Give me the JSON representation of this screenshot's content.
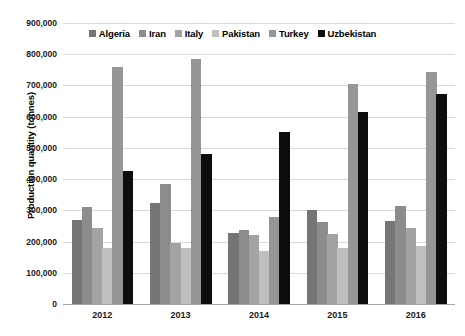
{
  "chart_data": {
    "type": "bar",
    "title": "",
    "subtitle": "",
    "xlabel": "",
    "ylabel": "Production quantity (tonnes)",
    "categories": [
      "2012",
      "2013",
      "2014",
      "2015",
      "2016"
    ],
    "ylim": [
      0,
      900000
    ],
    "ytick_values": [
      0,
      100000,
      200000,
      300000,
      400000,
      500000,
      600000,
      700000,
      800000,
      900000
    ],
    "ytick_labels": [
      "0",
      "100,000",
      "200,000",
      "300,000",
      "400,000",
      "500,000",
      "600,000",
      "700,000",
      "800,000",
      "900,000"
    ],
    "grid": true,
    "legend_position": "top-center",
    "series": [
      {
        "name": "Algeria",
        "color": "#757575",
        "values": [
          270000,
          322000,
          228000,
          300000,
          265000
        ]
      },
      {
        "name": "Iran",
        "color": "#8c8c8c",
        "values": [
          310000,
          383000,
          238000,
          262000,
          315000
        ]
      },
      {
        "name": "Italy",
        "color": "#a3a3a3",
        "values": [
          245000,
          196000,
          222000,
          225000,
          243000
        ]
      },
      {
        "name": "Pakistan",
        "color": "#bfbfbf",
        "values": [
          178000,
          180000,
          170000,
          178000,
          185000
        ]
      },
      {
        "name": "Turkey",
        "color": "#969696",
        "values": [
          760000,
          785000,
          280000,
          705000,
          742000
        ]
      },
      {
        "name": "Uzbekistan",
        "color": "#0d0d0d",
        "values": [
          425000,
          480000,
          550000,
          615000,
          672000
        ]
      }
    ]
  },
  "axis": {
    "y_title": "Production quantity (tonnes)"
  },
  "legend": {
    "items": [
      {
        "label": "Algeria"
      },
      {
        "label": "Iran"
      },
      {
        "label": "Italy"
      },
      {
        "label": "Pakistan"
      },
      {
        "label": "Turkey"
      },
      {
        "label": "Uzbekistan"
      }
    ]
  }
}
